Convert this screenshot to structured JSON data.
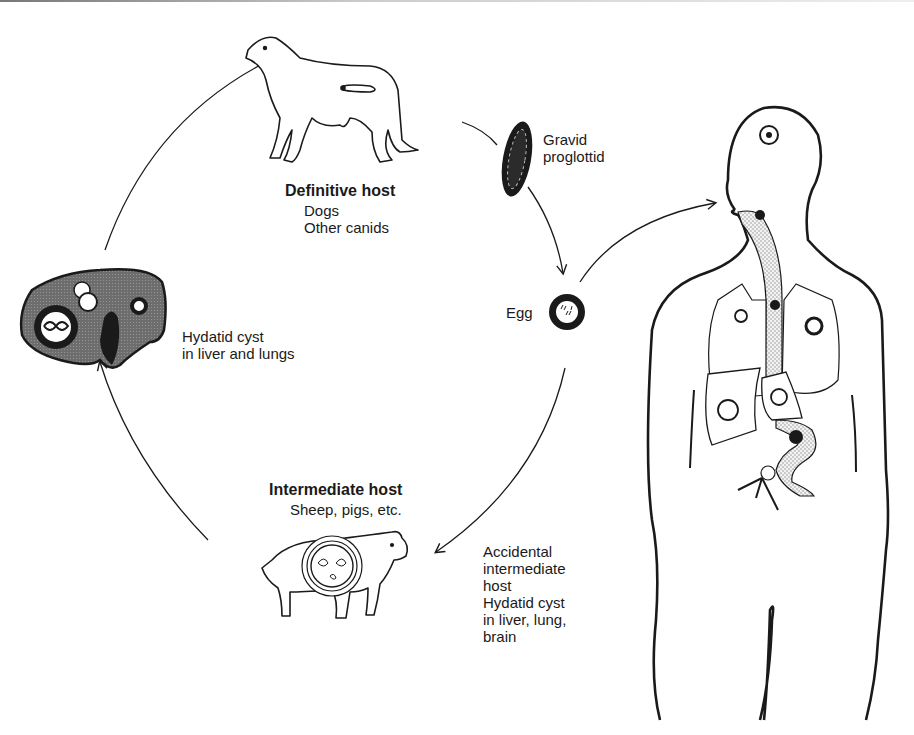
{
  "diagram": {
    "definitive_host": {
      "heading": "Definitive host",
      "line1": "Dogs",
      "line2": "Other canids"
    },
    "proglottid": {
      "line1": "Gravid",
      "line2": "proglottid"
    },
    "egg": {
      "label": "Egg"
    },
    "hydatid_cyst": {
      "line1": "Hydatid cyst",
      "line2": "in liver and lungs"
    },
    "intermediate_host": {
      "heading": "Intermediate host",
      "line1": "Sheep, pigs, etc."
    },
    "accidental_host": {
      "lines": [
        "Accidental",
        "intermediate",
        "host",
        "Hydatid cyst",
        "in liver, lung,",
        "brain"
      ]
    },
    "colors": {
      "ink": "#1a1a1a",
      "stipple": "#bdbdbd",
      "organ_fill": "#7a7a7a"
    }
  }
}
